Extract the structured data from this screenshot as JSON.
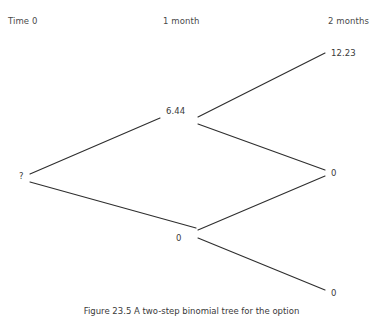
{
  "figure": {
    "caption": "Figure 23.5  A two-step binomial tree for the option",
    "background_color": "#ffffff",
    "line_color": "#2e2e2e",
    "text_color": "#3a3a3a"
  },
  "columns": [
    {
      "label": "Time 0",
      "x": 8,
      "y": 16
    },
    {
      "label": "1 month",
      "x": 163,
      "y": 16
    },
    {
      "label": "2 months",
      "x": 328,
      "y": 16
    }
  ],
  "nodes": [
    {
      "id": "root",
      "label": "?",
      "x": 19,
      "y": 171,
      "step": 0,
      "level": 0
    },
    {
      "id": "up",
      "label": "6.44",
      "x": 166,
      "y": 106,
      "step": 1,
      "level": 1
    },
    {
      "id": "down",
      "label": "0",
      "x": 176,
      "y": 233,
      "step": 1,
      "level": 0
    },
    {
      "id": "up-up",
      "label": "12.23",
      "x": 331,
      "y": 48,
      "step": 2,
      "level": 2
    },
    {
      "id": "up-down",
      "label": "0",
      "x": 331,
      "y": 168,
      "step": 2,
      "level": 1
    },
    {
      "id": "down-down",
      "label": "0",
      "x": 331,
      "y": 288,
      "step": 2,
      "level": 0
    }
  ],
  "edges": [
    {
      "id": "root-to-up",
      "from": "root",
      "to": "up",
      "x1": 30,
      "y1": 174,
      "x2": 160,
      "y2": 118
    },
    {
      "id": "root-to-down",
      "from": "root",
      "to": "down",
      "x1": 30,
      "y1": 182,
      "x2": 196,
      "y2": 228
    },
    {
      "id": "up-to-up-up",
      "from": "up",
      "to": "up-up",
      "x1": 198,
      "y1": 117,
      "x2": 325,
      "y2": 53
    },
    {
      "id": "up-to-up-down",
      "from": "up",
      "to": "up-down",
      "x1": 198,
      "y1": 124,
      "x2": 325,
      "y2": 170
    },
    {
      "id": "down-to-up-down",
      "from": "down",
      "to": "up-down",
      "x1": 198,
      "y1": 230,
      "x2": 325,
      "y2": 176
    },
    {
      "id": "down-to-down-down",
      "from": "down",
      "to": "down-down",
      "x1": 198,
      "y1": 238,
      "x2": 325,
      "y2": 290
    }
  ],
  "chart_data": {
    "type": "diagram",
    "diagram_type": "binomial-tree",
    "title": "Two-step binomial tree",
    "steps": [
      "Time 0",
      "1 month",
      "2 months"
    ],
    "values": [
      [
        "?"
      ],
      [
        "6.44",
        "0"
      ],
      [
        "12.23",
        "0",
        "0"
      ]
    ]
  }
}
